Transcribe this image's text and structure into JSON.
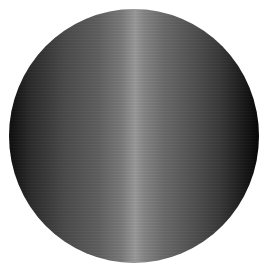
{
  "image": {
    "subject": "shaded-cylinder-circle",
    "description": "Gray metallic circle with vertical highlight band",
    "top_text_clipped": "",
    "colors": {
      "background": "#ffffff",
      "edge_left": "#0e0e0e",
      "mid_left": "#4a4a4a",
      "highlight": "#999999",
      "mid_right": "#555555",
      "edge_right": "#050505"
    }
  }
}
